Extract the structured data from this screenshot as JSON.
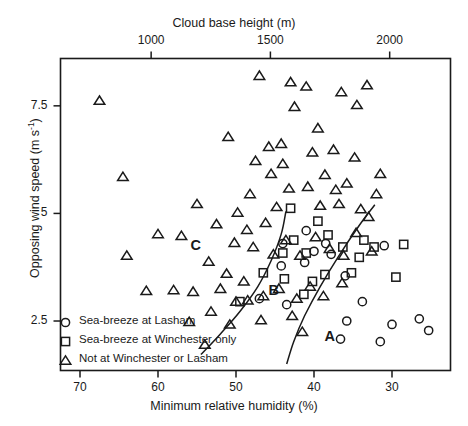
{
  "chart_data": {
    "type": "scatter",
    "title": "",
    "xlabel": "Minimum relative humidity (%)",
    "ylabel": "Opposing wind speed (m s-1)",
    "ylabel_display": "Opposing wind speed (m s",
    "ylabel_exp": "-1",
    "ylabel_tail": ")",
    "x2label": "Cloud base height (m)",
    "xlim": [
      72.5,
      22.5
    ],
    "x_reversed": true,
    "ylim": [
      1.35,
      8.6
    ],
    "x2lim": [
      620,
      2255
    ],
    "grid": false,
    "xticks": [
      70,
      60,
      50,
      40,
      30
    ],
    "xticklabels": [
      "70",
      "60",
      "50",
      "40",
      "30"
    ],
    "x2ticks": [
      1000,
      1500,
      2000
    ],
    "x2ticklabels": [
      "1000",
      "1500",
      "2000"
    ],
    "yticks": [
      2.5,
      5,
      7.5
    ],
    "yticklabels": [
      "2.5",
      "5",
      "7.5"
    ],
    "legend_position": "lower-left-inside",
    "series": [
      {
        "name": "Sea-breeze at Lasham",
        "marker": "circle",
        "legend_label": "Sea-breeze at Lasham",
        "points": [
          [
            44.0,
            4.3
          ],
          [
            41.0,
            4.6
          ],
          [
            40.0,
            4.12
          ],
          [
            38.5,
            4.3
          ],
          [
            37.8,
            4.05
          ],
          [
            41.2,
            3.86
          ],
          [
            44.2,
            3.78
          ],
          [
            36.0,
            3.55
          ],
          [
            31.0,
            4.25
          ],
          [
            33.8,
            2.95
          ],
          [
            35.8,
            2.5
          ],
          [
            30.0,
            2.42
          ],
          [
            31.5,
            2.02
          ],
          [
            26.5,
            2.55
          ],
          [
            25.3,
            2.28
          ],
          [
            43.5,
            2.88
          ],
          [
            36.6,
            2.08
          ],
          [
            47.0,
            3.02
          ]
        ]
      },
      {
        "name": "Sea-breeze at Winchester only",
        "marker": "square",
        "legend_label": "Sea-breeze at Winchester only",
        "points": [
          [
            43.0,
            5.12
          ],
          [
            42.6,
            4.38
          ],
          [
            39.5,
            4.82
          ],
          [
            38.2,
            4.5
          ],
          [
            41.0,
            4.08
          ],
          [
            36.3,
            4.22
          ],
          [
            33.6,
            4.38
          ],
          [
            34.2,
            3.98
          ],
          [
            32.3,
            4.22
          ],
          [
            35.2,
            3.62
          ],
          [
            38.6,
            3.58
          ],
          [
            40.2,
            3.42
          ],
          [
            44.0,
            4.08
          ],
          [
            46.5,
            3.62
          ],
          [
            43.8,
            3.48
          ],
          [
            28.5,
            4.28
          ],
          [
            29.5,
            3.52
          ],
          [
            49.5,
            2.95
          ],
          [
            41.3,
            3.12
          ]
        ]
      },
      {
        "name": "Not at Winchester or Lasham",
        "marker": "triangle",
        "legend_label": "Not at Winchester or Lasham",
        "points": [
          [
            67.5,
            7.62
          ],
          [
            64.5,
            5.85
          ],
          [
            51.0,
            6.78
          ],
          [
            47.5,
            6.22
          ],
          [
            55.0,
            5.22
          ],
          [
            48.2,
            5.45
          ],
          [
            47.0,
            8.2
          ],
          [
            43.0,
            8.05
          ],
          [
            41.0,
            7.95
          ],
          [
            36.5,
            7.82
          ],
          [
            33.2,
            7.98
          ],
          [
            34.5,
            7.52
          ],
          [
            42.5,
            7.48
          ],
          [
            39.5,
            6.98
          ],
          [
            44.0,
            6.15
          ],
          [
            45.5,
            5.92
          ],
          [
            43.2,
            5.58
          ],
          [
            40.8,
            5.62
          ],
          [
            38.6,
            5.9
          ],
          [
            37.2,
            5.55
          ],
          [
            35.8,
            5.7
          ],
          [
            39.2,
            5.18
          ],
          [
            36.8,
            5.22
          ],
          [
            34.0,
            5.1
          ],
          [
            32.0,
            5.45
          ],
          [
            33.0,
            4.92
          ],
          [
            44.8,
            5.15
          ],
          [
            46.2,
            4.78
          ],
          [
            48.6,
            4.62
          ],
          [
            50.2,
            4.32
          ],
          [
            47.8,
            4.22
          ],
          [
            45.2,
            4.05
          ],
          [
            43.6,
            4.38
          ],
          [
            41.8,
            4.02
          ],
          [
            39.8,
            4.45
          ],
          [
            38.0,
            4.18
          ],
          [
            36.2,
            4.02
          ],
          [
            34.6,
            4.55
          ],
          [
            32.6,
            4.12
          ],
          [
            53.5,
            3.88
          ],
          [
            51.2,
            3.6
          ],
          [
            49.0,
            3.42
          ],
          [
            52.0,
            3.25
          ],
          [
            55.5,
            3.18
          ],
          [
            58.0,
            3.22
          ],
          [
            61.5,
            3.2
          ],
          [
            50.0,
            2.95
          ],
          [
            53.2,
            2.72
          ],
          [
            48.5,
            2.98
          ],
          [
            46.5,
            3.08
          ],
          [
            44.5,
            3.25
          ],
          [
            42.2,
            3.02
          ],
          [
            40.5,
            3.3
          ],
          [
            38.8,
            3.08
          ],
          [
            36.4,
            3.38
          ],
          [
            46.8,
            2.52
          ],
          [
            50.8,
            2.42
          ],
          [
            54.0,
            1.95
          ],
          [
            42.8,
            2.62
          ],
          [
            41.5,
            2.25
          ],
          [
            49.8,
            5.02
          ],
          [
            45.8,
            6.55
          ],
          [
            52.5,
            4.75
          ],
          [
            57.0,
            4.48
          ],
          [
            60.0,
            4.52
          ],
          [
            64.0,
            4.02
          ],
          [
            56.0,
            2.48
          ],
          [
            44.2,
            6.62
          ],
          [
            34.8,
            6.3
          ],
          [
            31.5,
            5.92
          ],
          [
            37.5,
            6.48
          ],
          [
            40.2,
            6.42
          ]
        ]
      }
    ],
    "region_labels": [
      {
        "text": "A",
        "x": 38.0,
        "y": 2.1
      },
      {
        "text": "B",
        "x": 45.2,
        "y": 3.18
      },
      {
        "text": "C",
        "x": 55.2,
        "y": 4.22
      }
    ],
    "dividing_curves": [
      {
        "name": "curve-B-C",
        "points": [
          [
            54.5,
            1.72
          ],
          [
            52.0,
            2.2
          ],
          [
            49.5,
            2.72
          ],
          [
            47.2,
            3.3
          ],
          [
            45.5,
            3.9
          ],
          [
            44.2,
            4.52
          ],
          [
            43.6,
            5.05
          ]
        ]
      },
      {
        "name": "curve-A-B",
        "points": [
          [
            43.5,
            1.5
          ],
          [
            42.6,
            2.02
          ],
          [
            41.2,
            2.62
          ],
          [
            39.2,
            3.3
          ],
          [
            36.8,
            4.02
          ],
          [
            34.2,
            4.72
          ],
          [
            32.2,
            5.2
          ]
        ]
      }
    ]
  }
}
